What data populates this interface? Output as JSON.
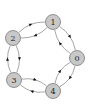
{
  "diagram": {
    "type": "directed-graph",
    "node_fill": "#c8c8c8",
    "edge_color": "#808080",
    "arrow_color": "#111111",
    "nodes": [
      {
        "id": "0",
        "label": "0"
      },
      {
        "id": "1",
        "label": "1"
      },
      {
        "id": "2",
        "label": "2"
      },
      {
        "id": "3",
        "label": "3"
      },
      {
        "id": "4",
        "label": "4"
      }
    ],
    "edges": [
      {
        "from": "1",
        "to": "2"
      },
      {
        "from": "2",
        "to": "1"
      },
      {
        "from": "1",
        "to": "0"
      },
      {
        "from": "0",
        "to": "1"
      },
      {
        "from": "2",
        "to": "3"
      },
      {
        "from": "3",
        "to": "2"
      },
      {
        "from": "3",
        "to": "4"
      },
      {
        "from": "4",
        "to": "3"
      },
      {
        "from": "0",
        "to": "4"
      },
      {
        "from": "4",
        "to": "0"
      }
    ]
  }
}
